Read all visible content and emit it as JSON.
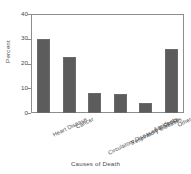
{
  "chart_data": {
    "type": "bar",
    "title": "",
    "xlabel": "Causes of Death",
    "ylabel": "Percent",
    "categories": [
      "Heart Disease",
      "Cancer",
      "Circulatory Diseases & Stroke",
      "Respiratory Diseases",
      "Accidents",
      "Other"
    ],
    "values": [
      30,
      22.5,
      8,
      7.5,
      4,
      26
    ],
    "ylim": [
      0,
      40
    ],
    "yticks": [
      0,
      10,
      20,
      30,
      40
    ],
    "ytick_labels": [
      "0",
      "10",
      "20",
      "30",
      "40"
    ],
    "grid": false,
    "legend": false,
    "bar_color": "#5c5c5c",
    "frame_color": "#8d8d8d",
    "background": "#ffffff"
  }
}
